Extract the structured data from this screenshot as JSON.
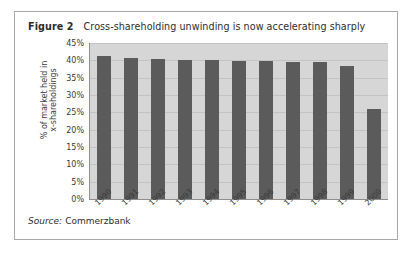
{
  "figure": {
    "label": "Figure 2",
    "caption": "Cross-shareholding unwinding is now accelerating sharply",
    "source_label": "Source:",
    "source_value": "Commerzbank"
  },
  "axis": {
    "y_title_line1": "% of market held in",
    "y_title_line2": "x-shareholdings"
  },
  "colors": {
    "plot_background": "#d6d6d6",
    "bar_fill": "#5b5b5b",
    "gridline": "#c3c3c3",
    "frame_border": "#a8a8a8",
    "text": "#2d2d2d"
  },
  "chart_data": {
    "type": "bar",
    "title": "Cross-shareholding unwinding is now accelerating sharply",
    "subtitle": "Figure 2",
    "xlabel": "",
    "ylabel": "% of market held in x-shareholdings",
    "categories": [
      "1990",
      "1991",
      "1992",
      "1993",
      "1994",
      "1995",
      "1996",
      "1997",
      "1998",
      "1999",
      "2000"
    ],
    "values": [
      41.3,
      40.8,
      40.4,
      40.1,
      40.0,
      39.7,
      39.7,
      39.6,
      39.4,
      38.4,
      26.0
    ],
    "ylim": [
      0,
      45
    ],
    "ytick_labels": [
      "0%",
      "5%",
      "10%",
      "15%",
      "20%",
      "25%",
      "30%",
      "35%",
      "40%",
      "45%"
    ],
    "ytick_values": [
      0,
      5,
      10,
      15,
      20,
      25,
      30,
      35,
      40,
      45
    ],
    "grid": true,
    "legend": false,
    "legend_position": "none",
    "source": "Commerzbank"
  }
}
